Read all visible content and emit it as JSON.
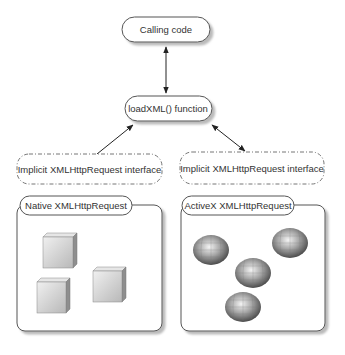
{
  "diagram": {
    "calling_code": {
      "label": "Calling code"
    },
    "load_xml": {
      "label": "loadXML() function"
    },
    "interface_left": {
      "label": "Implicit XMLHttpRequest interface"
    },
    "interface_right": {
      "label": "Implicit XMLHttpRequest interface"
    },
    "native_container": {
      "label": "Native XMLHttpRequest",
      "objects": [
        "cube",
        "cube",
        "cube"
      ]
    },
    "activex_container": {
      "label": "ActiveX XMLHttpRequest",
      "objects": [
        "sphere",
        "sphere",
        "sphere",
        "sphere"
      ]
    },
    "connections": [
      {
        "from": "calling_code",
        "to": "load_xml",
        "arrows": "both"
      },
      {
        "from": "interface_left",
        "to": "load_xml",
        "arrows": "end"
      },
      {
        "from": "load_xml",
        "to": "interface_right",
        "arrows": "both"
      }
    ],
    "colors": {
      "stroke": "#555555",
      "shadow": "#9a9a9a",
      "fill": "#ffffff",
      "text": "#333333"
    }
  }
}
